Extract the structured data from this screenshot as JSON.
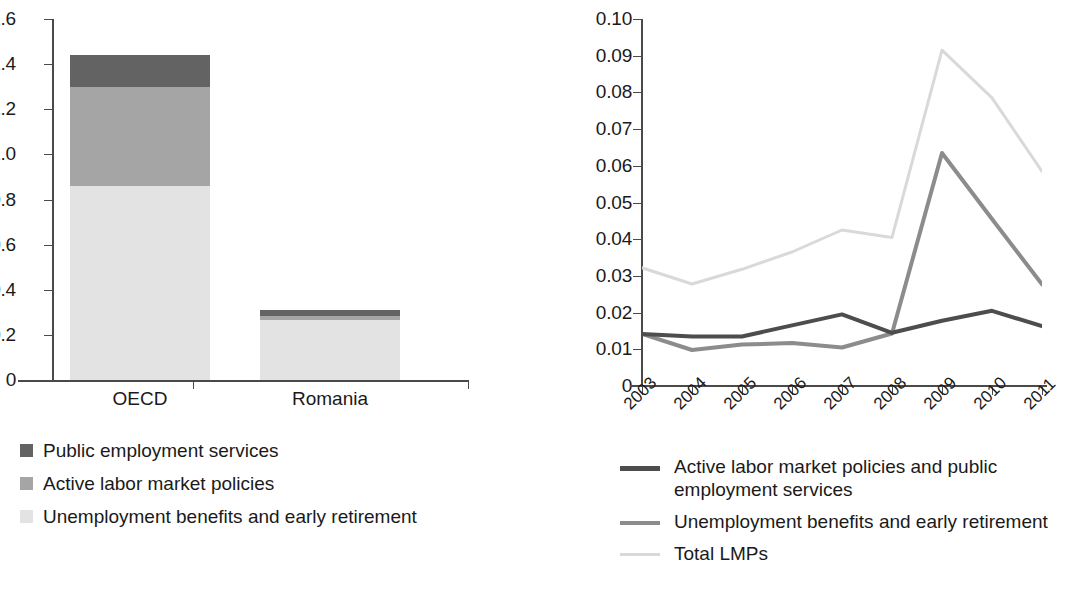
{
  "chart_data": [
    {
      "type": "bar",
      "subtype": "stacked-bar",
      "title": "",
      "xlabel": "",
      "ylabel": "",
      "categories": [
        "OECD",
        "Romania"
      ],
      "ylim": [
        0,
        1.6
      ],
      "ytick_labels": [
        "0",
        "0.2",
        "0.4",
        "0.6",
        "0.8",
        "1.0",
        "1.2",
        "1.4",
        "1.6"
      ],
      "ytick_values": [
        0,
        0.2,
        0.4,
        0.6,
        0.8,
        1.0,
        1.2,
        1.4,
        1.6
      ],
      "grid": false,
      "legend_position": "below",
      "stack_order_bottom_to_top": [
        "Unemployment benefits and early retirement",
        "Active labor market policies",
        "Public employment services"
      ],
      "series": [
        {
          "name": "Public employment services",
          "color": "#636363",
          "values": [
            0.14,
            0.025
          ]
        },
        {
          "name": "Active labor market policies",
          "color": "#a5a5a5",
          "values": [
            0.44,
            0.02
          ]
        },
        {
          "name": "Unemployment benefits and early retirement",
          "color": "#e3e3e3",
          "values": [
            0.86,
            0.265
          ]
        }
      ],
      "totals": [
        1.44,
        0.31
      ]
    },
    {
      "type": "line",
      "title": "",
      "xlabel": "",
      "ylabel": "",
      "x": [
        "2003",
        "2004",
        "2005",
        "2006",
        "2007",
        "2008",
        "2009",
        "2010",
        "2011"
      ],
      "ylim": [
        0,
        0.1
      ],
      "ytick_labels": [
        "0",
        "0.01",
        "0.02",
        "0.03",
        "0.04",
        "0.05",
        "0.06",
        "0.07",
        "0.08",
        "0.09",
        "0.10"
      ],
      "ytick_values": [
        0,
        0.01,
        0.02,
        0.03,
        0.04,
        0.05,
        0.06,
        0.07,
        0.08,
        0.09,
        0.1
      ],
      "grid": false,
      "legend_position": "below",
      "series": [
        {
          "name": "Active labor market policies and public employment services",
          "color": "#4d4d4d",
          "width": 4,
          "values": [
            0.0142,
            0.0135,
            0.0135,
            0.0165,
            0.0195,
            0.0145,
            0.0178,
            0.0205,
            0.0163
          ]
        },
        {
          "name": "Unemployment benefits and early retirement",
          "color": "#8c8c8c",
          "width": 4,
          "values": [
            0.0142,
            0.0098,
            0.0113,
            0.0117,
            0.0105,
            0.0143,
            0.0635,
            0.0455,
            0.0277
          ]
        },
        {
          "name": "Total LMPs",
          "color": "#d9d9d9",
          "width": 3,
          "values": [
            0.0322,
            0.0278,
            0.0318,
            0.0365,
            0.0425,
            0.0405,
            0.0915,
            0.0785,
            0.0585
          ]
        }
      ]
    }
  ],
  "bar_chart": {
    "y_axis": {
      "ticks": [
        "1.6",
        "1.4",
        "1.2",
        "1.0",
        "0.8",
        "0.6",
        "0.4",
        "0.2",
        "0"
      ]
    },
    "categories": [
      {
        "label": "OECD"
      },
      {
        "label": "Romania"
      }
    ],
    "legend": [
      {
        "label": "Public employment services",
        "color": "#636363"
      },
      {
        "label": "Active labor market policies",
        "color": "#a5a5a5"
      },
      {
        "label": "Unemployment benefits and early retirement",
        "color": "#e3e3e3"
      }
    ]
  },
  "line_chart": {
    "y_axis": {
      "ticks": [
        "0.10",
        "0.09",
        "0.08",
        "0.07",
        "0.06",
        "0.05",
        "0.04",
        "0.03",
        "0.02",
        "0.01",
        "0"
      ]
    },
    "x_axis": {
      "ticks": [
        "2003",
        "2004",
        "2005",
        "2006",
        "2007",
        "2008",
        "2009",
        "2010",
        "2011"
      ]
    },
    "legend": [
      {
        "label": "Active labor market policies and public employment services",
        "color": "#4d4d4d"
      },
      {
        "label": "Unemployment benefits and early retirement",
        "color": "#8c8c8c"
      },
      {
        "label": "Total LMPs",
        "color": "#d9d9d9"
      }
    ]
  }
}
